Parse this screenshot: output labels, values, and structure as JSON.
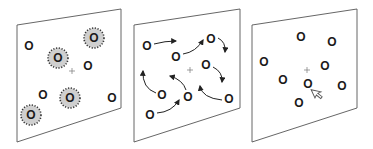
{
  "diagram": {
    "panels": [
      {
        "id": "panel-1",
        "description": "molecules with surrounding halos",
        "molecule_label": "O",
        "molecules": [
          {
            "x": 29,
            "y": 46,
            "halo": false
          },
          {
            "x": 58,
            "y": 58,
            "halo": true
          },
          {
            "x": 94,
            "y": 38,
            "halo": true
          },
          {
            "x": 88,
            "y": 66,
            "halo": false
          },
          {
            "x": 43,
            "y": 95,
            "halo": false
          },
          {
            "x": 70,
            "y": 98,
            "halo": true
          },
          {
            "x": 112,
            "y": 98,
            "halo": false
          },
          {
            "x": 31,
            "y": 115,
            "halo": true
          }
        ],
        "center_mark": "+"
      },
      {
        "id": "panel-2",
        "description": "molecules moving with arrows",
        "molecule_label": "O",
        "molecules": [
          {
            "x": 147,
            "y": 46
          },
          {
            "x": 176,
            "y": 57
          },
          {
            "x": 211,
            "y": 39
          },
          {
            "x": 206,
            "y": 65
          },
          {
            "x": 162,
            "y": 95
          },
          {
            "x": 188,
            "y": 97
          },
          {
            "x": 229,
            "y": 99
          },
          {
            "x": 150,
            "y": 115
          }
        ],
        "center_mark": "+"
      },
      {
        "id": "panel-3",
        "description": "molecules with pointer cursor",
        "molecule_label": "O",
        "molecules": [
          {
            "x": 264,
            "y": 62
          },
          {
            "x": 301,
            "y": 37
          },
          {
            "x": 332,
            "y": 42
          },
          {
            "x": 325,
            "y": 66
          },
          {
            "x": 283,
            "y": 80
          },
          {
            "x": 308,
            "y": 84
          },
          {
            "x": 342,
            "y": 86
          },
          {
            "x": 299,
            "y": 103
          }
        ],
        "center_mark": "+"
      }
    ],
    "colors": {
      "halo_fill": "#cfcfcf",
      "stroke": "#555555",
      "text": "#1a1a1a"
    }
  }
}
